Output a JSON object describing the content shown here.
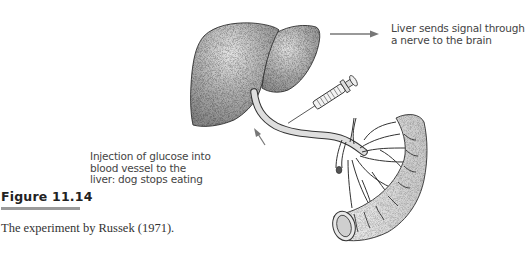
{
  "figure": {
    "number": "Figure 11.14",
    "caption": "The experiment by Russek (1971).",
    "bar_color": "#9a9a9a"
  },
  "annotations": {
    "signal": {
      "lines": [
        "Liver sends signal through",
        "a nerve to the brain"
      ]
    },
    "injection": {
      "lines": [
        "Injection of glucose into",
        "blood vessel to the",
        "liver: dog stops eating"
      ]
    }
  },
  "illustration": {
    "subjects": [
      "liver",
      "hepatic-portal-vein",
      "syringe",
      "intestine"
    ],
    "arrow_color": "#777777",
    "organ_fill": "#b8b8b8",
    "outline_color": "#333333"
  }
}
